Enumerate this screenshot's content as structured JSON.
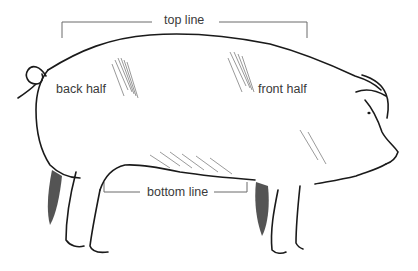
{
  "diagram": {
    "labels": {
      "top_line": "top line",
      "bottom_line": "bottom line",
      "back_half": "back half",
      "front_half": "front half"
    },
    "colors": {
      "outline": "#1a1a1a",
      "bracket": "#6a6a6a",
      "label_text": "#3a3a3a",
      "shading": "#555555"
    }
  }
}
